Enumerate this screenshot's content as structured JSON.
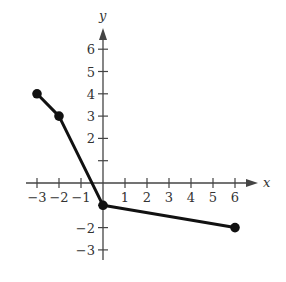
{
  "chart_data": {
    "type": "line",
    "title": "",
    "xlabel": "x",
    "ylabel": "y",
    "xlim": [
      -3.3,
      7.0
    ],
    "ylim": [
      -3.5,
      7.0
    ],
    "grid": false,
    "legend": null,
    "x_ticks": [
      -3,
      -2,
      -1,
      1,
      2,
      3,
      4,
      5,
      6
    ],
    "x_tick_labels": [
      "−3",
      "−2",
      "−1",
      "1",
      "2",
      "3",
      "4",
      "5",
      "6"
    ],
    "y_ticks": [
      -3,
      -2,
      -1,
      1,
      2,
      3,
      4,
      5,
      6
    ],
    "y_tick_labels": [
      "−3",
      "−2",
      "",
      "",
      "2",
      "3",
      "4",
      "5",
      "6"
    ],
    "series": [
      {
        "name": "piecewise linear function",
        "x": [
          -3,
          -2,
          0,
          6
        ],
        "y": [
          4,
          3,
          -1,
          -2
        ],
        "closed_endpoints": true,
        "color": "#111111"
      }
    ]
  },
  "style": {
    "axis_color": "#444444",
    "line_color": "#111111"
  }
}
